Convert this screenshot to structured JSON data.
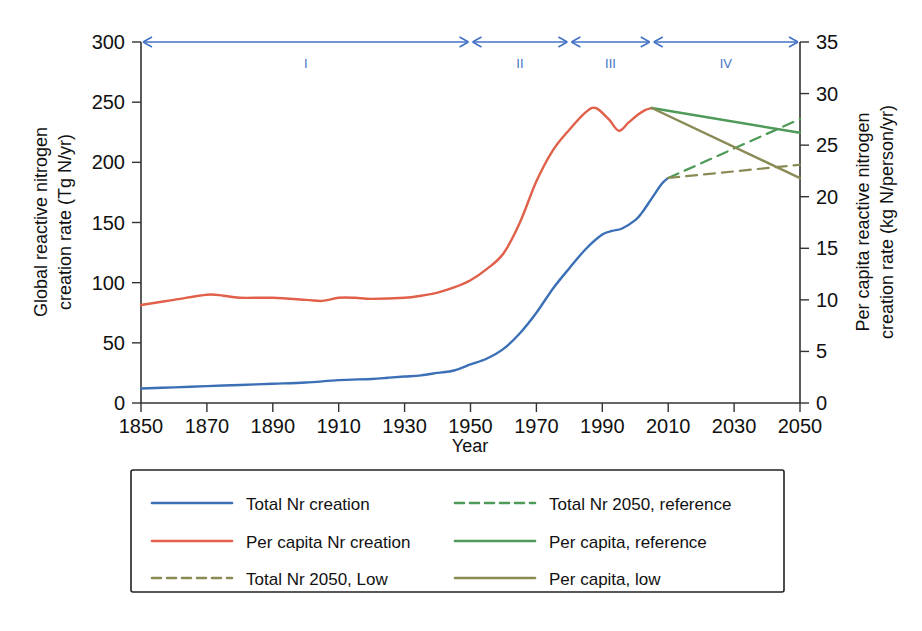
{
  "chart_data": {
    "type": "line",
    "title": "",
    "xlabel": "Year",
    "ylabel": "Global reactive nitrogen creation rate (Tg N/yr)",
    "ylabel_right": "Per capita reactive nitrogen creation rate (kg N/person/yr)",
    "xlim": [
      1850,
      2050
    ],
    "ylim": [
      0,
      300
    ],
    "ylim_right": [
      0,
      35
    ],
    "xticks": [
      1850,
      1870,
      1890,
      1910,
      1930,
      1950,
      1970,
      1990,
      2010,
      2030,
      2050
    ],
    "yticks": [
      0,
      50,
      100,
      150,
      200,
      250,
      300
    ],
    "yticks_right": [
      0,
      5,
      10,
      15,
      20,
      25,
      30,
      35
    ],
    "grid": false,
    "legend_position": "below",
    "colors": {
      "total_nr": "#3B6FB6",
      "per_capita": "#E1604A",
      "reference_green": "#4E9A58",
      "low_olive": "#8A8A55"
    },
    "annotations": {
      "phase_labels": [
        "I",
        "II",
        "III",
        "IV"
      ],
      "phase_boundaries": [
        1850,
        1950,
        1980,
        2005,
        2050
      ]
    },
    "series": [
      {
        "name": "Total Nr creation",
        "axis": "left",
        "style": "solid",
        "color": "#3B6FB6",
        "points": [
          [
            1850,
            12
          ],
          [
            1860,
            13
          ],
          [
            1870,
            14
          ],
          [
            1880,
            15
          ],
          [
            1890,
            16
          ],
          [
            1900,
            17
          ],
          [
            1910,
            19
          ],
          [
            1920,
            20
          ],
          [
            1925,
            21
          ],
          [
            1930,
            22
          ],
          [
            1935,
            23
          ],
          [
            1940,
            25
          ],
          [
            1945,
            27
          ],
          [
            1950,
            32
          ],
          [
            1955,
            37
          ],
          [
            1960,
            45
          ],
          [
            1965,
            58
          ],
          [
            1970,
            75
          ],
          [
            1975,
            95
          ],
          [
            1980,
            112
          ],
          [
            1985,
            128
          ],
          [
            1990,
            140
          ],
          [
            1993,
            143
          ],
          [
            1996,
            145
          ],
          [
            2000,
            152
          ],
          [
            2002,
            158
          ],
          [
            2005,
            170
          ],
          [
            2008,
            182
          ],
          [
            2010,
            187
          ]
        ]
      },
      {
        "name": "Per capita Nr creation",
        "axis": "right",
        "style": "solid",
        "color": "#E1604A",
        "points": [
          [
            1850,
            9.5
          ],
          [
            1860,
            10.0
          ],
          [
            1870,
            10.5
          ],
          [
            1875,
            10.4
          ],
          [
            1880,
            10.2
          ],
          [
            1890,
            10.2
          ],
          [
            1900,
            10.0
          ],
          [
            1905,
            9.9
          ],
          [
            1910,
            10.2
          ],
          [
            1915,
            10.2
          ],
          [
            1920,
            10.1
          ],
          [
            1930,
            10.2
          ],
          [
            1935,
            10.4
          ],
          [
            1940,
            10.7
          ],
          [
            1945,
            11.2
          ],
          [
            1950,
            11.9
          ],
          [
            1955,
            13.0
          ],
          [
            1960,
            14.5
          ],
          [
            1965,
            17.5
          ],
          [
            1970,
            21.5
          ],
          [
            1975,
            24.5
          ],
          [
            1980,
            26.5
          ],
          [
            1985,
            28.2
          ],
          [
            1988,
            28.6
          ],
          [
            1992,
            27.5
          ],
          [
            1995,
            26.4
          ],
          [
            1998,
            27.2
          ],
          [
            2001,
            28.0
          ],
          [
            2003,
            28.4
          ],
          [
            2005,
            28.6
          ]
        ]
      },
      {
        "name": "Total Nr 2050, reference",
        "axis": "left",
        "style": "dashed",
        "color": "#4E9A58",
        "points": [
          [
            2010,
            187
          ],
          [
            2050,
            236
          ]
        ]
      },
      {
        "name": "Total Nr 2050, Low",
        "axis": "left",
        "style": "dashed",
        "color": "#8A8A55",
        "points": [
          [
            2010,
            187
          ],
          [
            2050,
            198
          ]
        ]
      },
      {
        "name": "Per capita, reference",
        "axis": "right",
        "style": "solid",
        "color": "#4E9A58",
        "points": [
          [
            2005,
            28.6
          ],
          [
            2050,
            26.2
          ]
        ]
      },
      {
        "name": "Per capita, low",
        "axis": "right",
        "style": "solid",
        "color": "#8A8A55",
        "points": [
          [
            2005,
            28.6
          ],
          [
            2050,
            21.8
          ]
        ]
      }
    ]
  },
  "legend": {
    "entries": [
      {
        "label": "Total Nr creation",
        "color": "#3B6FB6",
        "style": "solid",
        "col": 0,
        "row": 0
      },
      {
        "label": "Per capita Nr creation",
        "color": "#E1604A",
        "style": "solid",
        "col": 0,
        "row": 1
      },
      {
        "label": "Total Nr 2050, Low",
        "color": "#8A8A55",
        "style": "dashed",
        "col": 0,
        "row": 2
      },
      {
        "label": "Total Nr 2050, reference",
        "color": "#4E9A58",
        "style": "dashed",
        "col": 1,
        "row": 0
      },
      {
        "label": "Per capita, reference",
        "color": "#4E9A58",
        "style": "solid",
        "col": 1,
        "row": 1
      },
      {
        "label": "Per capita, low",
        "color": "#8A8A55",
        "style": "solid",
        "col": 1,
        "row": 2
      }
    ]
  }
}
